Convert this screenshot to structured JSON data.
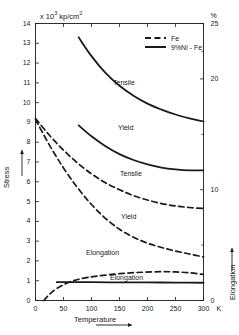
{
  "chart_data": {
    "type": "line",
    "title": "",
    "unit_label": "x 10³ kp/cm²",
    "xlabel": "Temperature",
    "x_unit": "K",
    "ylabel": "Stress",
    "y2label": "Elongation",
    "y2_unit": "%",
    "xlim": [
      0,
      300
    ],
    "ylim": [
      0,
      14
    ],
    "y2lim": [
      0,
      25
    ],
    "xticks": [
      0,
      50,
      100,
      150,
      200,
      250,
      300
    ],
    "yticks": [
      0,
      1,
      2,
      3,
      4,
      5,
      6,
      7,
      8,
      9,
      10,
      11,
      12,
      13,
      14
    ],
    "y2ticks": [
      0,
      10,
      20,
      25
    ],
    "grid": false,
    "legend_position": "top-right",
    "legend": [
      {
        "label": "Fe",
        "style": "dashed"
      },
      {
        "label": "9%Ni - Fe",
        "style": "solid"
      }
    ],
    "series": [
      {
        "name": "Tensile (9%Ni - Fe)",
        "annotation": "Tensile",
        "style": "solid",
        "axis": "left",
        "x": [
          77,
          100,
          125,
          150,
          175,
          200,
          225,
          250,
          275,
          300
        ],
        "y": [
          13.3,
          12.35,
          11.5,
          10.85,
          10.35,
          9.95,
          9.65,
          9.4,
          9.2,
          9.05
        ]
      },
      {
        "name": "Yield (9%Ni - Fe)",
        "annotation": "Yield",
        "style": "solid",
        "axis": "left",
        "x": [
          77,
          100,
          125,
          150,
          175,
          200,
          225,
          250,
          275,
          300
        ],
        "y": [
          8.85,
          8.3,
          7.8,
          7.4,
          7.1,
          6.88,
          6.72,
          6.63,
          6.58,
          6.58
        ]
      },
      {
        "name": "Tensile (Fe)",
        "annotation": "Tensile",
        "style": "dashed",
        "axis": "left",
        "x": [
          0,
          25,
          50,
          75,
          100,
          125,
          150,
          175,
          200,
          225,
          250,
          275,
          300
        ],
        "y": [
          9.2,
          8.35,
          7.6,
          6.95,
          6.4,
          5.95,
          5.6,
          5.3,
          5.08,
          4.9,
          4.78,
          4.7,
          4.65
        ]
      },
      {
        "name": "Yield (Fe)",
        "annotation": "Yield",
        "style": "dashed",
        "axis": "left",
        "x": [
          0,
          25,
          50,
          75,
          100,
          125,
          150,
          175,
          200,
          225,
          250,
          275,
          300
        ],
        "y": [
          9.15,
          7.85,
          6.7,
          5.7,
          4.85,
          4.15,
          3.6,
          3.2,
          2.9,
          2.68,
          2.5,
          2.35,
          2.2
        ]
      },
      {
        "name": "Elongation (Fe)",
        "annotation": "Elongation",
        "style": "dashed",
        "axis": "right",
        "x": [
          15,
          25,
          40,
          60,
          80,
          110,
          150,
          190,
          225,
          250,
          275,
          300
        ],
        "y": [
          0.0,
          0.55,
          1.15,
          1.65,
          1.95,
          2.2,
          2.42,
          2.55,
          2.6,
          2.58,
          2.5,
          2.35
        ]
      },
      {
        "name": "Elongation (9%Ni - Fe)",
        "annotation": "Elongation",
        "style": "solid",
        "axis": "right",
        "x": [
          38,
          100,
          150,
          200,
          250,
          300
        ],
        "y": [
          1.65,
          1.65,
          1.64,
          1.63,
          1.62,
          1.6
        ]
      }
    ],
    "annotations": [
      {
        "text": "Tensile",
        "x_px": 113,
        "y_px": 79
      },
      {
        "text": "Yield",
        "x_px": 118,
        "y_px": 124
      },
      {
        "text": "Tensile",
        "x_px": 120,
        "y_px": 170
      },
      {
        "text": "Yield",
        "x_px": 121,
        "y_px": 213
      },
      {
        "text": "Elongation",
        "x_px": 86,
        "y_px": 249
      },
      {
        "text": "Elongation",
        "x_px": 110,
        "y_px": 274
      }
    ]
  },
  "colors": {
    "ink": "#1a1a1a",
    "background": "#ffffff"
  }
}
